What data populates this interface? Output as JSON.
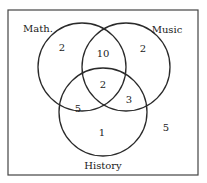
{
  "diagram": {
    "type": "venn-3",
    "frame": {
      "x": 8,
      "y": 10,
      "width": 190,
      "height": 165,
      "stroke": "#444444"
    },
    "sets": [
      {
        "name": "Math.",
        "cx": 82,
        "cy": 67,
        "r": 44,
        "label_x": 38,
        "label_y": 32,
        "anchor": "middle"
      },
      {
        "name": "Music",
        "cx": 126,
        "cy": 67,
        "r": 44,
        "label_x": 167,
        "label_y": 33,
        "anchor": "middle"
      },
      {
        "name": "History",
        "cx": 103,
        "cy": 112,
        "r": 44,
        "label_x": 103,
        "label_y": 169,
        "anchor": "middle"
      }
    ],
    "regions": [
      {
        "region": "Math only",
        "value": "2",
        "x": 62,
        "y": 51
      },
      {
        "region": "Math and Music only",
        "value": "10",
        "x": 103,
        "y": 57
      },
      {
        "region": "Music only",
        "value": "2",
        "x": 143,
        "y": 52
      },
      {
        "region": "Math, Music and History",
        "value": "2",
        "x": 103,
        "y": 88
      },
      {
        "region": "Math and History only",
        "value": "5",
        "x": 78,
        "y": 112
      },
      {
        "region": "Music and History only",
        "value": "3",
        "x": 129,
        "y": 103
      },
      {
        "region": "History only",
        "value": "1",
        "x": 102,
        "y": 136
      },
      {
        "region": "None",
        "value": "5",
        "x": 166,
        "y": 131
      }
    ],
    "stroke_color": "#2a2a2a"
  }
}
